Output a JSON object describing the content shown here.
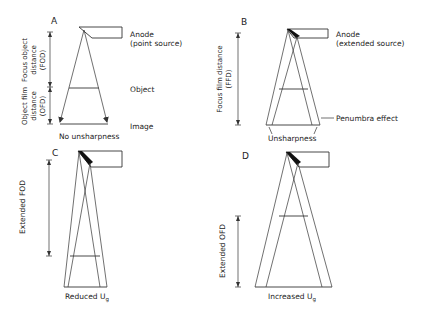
{
  "diagram": {
    "type": "radiography geometric unsharpness schematic",
    "panels": [
      {
        "id": "A",
        "label": "A",
        "anode_label_1": "Anode",
        "anode_label_2": "(point source)",
        "object_label": "Object",
        "image_label": "Image",
        "caption": "No unsharpness",
        "dim_fod_1": "Focus object",
        "dim_fod_2": "distance",
        "dim_fod_3": "(FOD)",
        "dim_ofd_1": "Object film",
        "dim_ofd_2": "distance",
        "dim_ofd_3": "(OFD)"
      },
      {
        "id": "B",
        "label": "B",
        "anode_label_1": "Anode",
        "anode_label_2": "(extended source)",
        "dim_ffd_1": "Focus film distance",
        "dim_ffd_2": "(FFD)",
        "penumbra_label": "Penumbra effect",
        "caption": "Unsharpness"
      },
      {
        "id": "C",
        "label": "C",
        "dim_label": "Extended FOD",
        "caption": "Reduced U",
        "caption_sub": "g"
      },
      {
        "id": "D",
        "label": "D",
        "dim_label": "Extended OFD",
        "caption": "Increased U",
        "caption_sub": "g"
      }
    ],
    "colors": {
      "line": "#333333",
      "text": "#222222",
      "background": "#ffffff"
    }
  }
}
